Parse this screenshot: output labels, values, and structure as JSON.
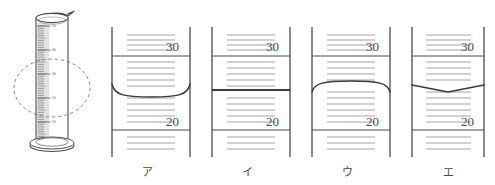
{
  "figure": {
    "title": "",
    "cylinder": {
      "name": "graduated-cylinder",
      "scale_labels": [
        "50",
        "40",
        "30",
        "20",
        "10"
      ],
      "callout": "dashed-ellipse-magnifier"
    },
    "panels": [
      {
        "label": "ア",
        "name": "panel-a",
        "surface_type": "concave-meniscus",
        "major_ticks": [
          "30",
          "20"
        ],
        "surface_position": "between-30-and-20"
      },
      {
        "label": "イ",
        "name": "panel-i",
        "surface_type": "flat-line",
        "major_ticks": [
          "30",
          "20"
        ],
        "surface_position": "between-30-and-20"
      },
      {
        "label": "ウ",
        "name": "panel-u",
        "surface_type": "convex-meniscus",
        "major_ticks": [
          "30",
          "20"
        ],
        "surface_position": "between-30-and-20"
      },
      {
        "label": "エ",
        "name": "panel-e",
        "surface_type": "v-shaped-line",
        "major_ticks": [
          "30",
          "20"
        ],
        "surface_position": "between-30-and-20"
      }
    ],
    "colors": {
      "ink": "#4a4a4a",
      "tick": "#8a8a8a",
      "background": "#ffffff"
    }
  }
}
